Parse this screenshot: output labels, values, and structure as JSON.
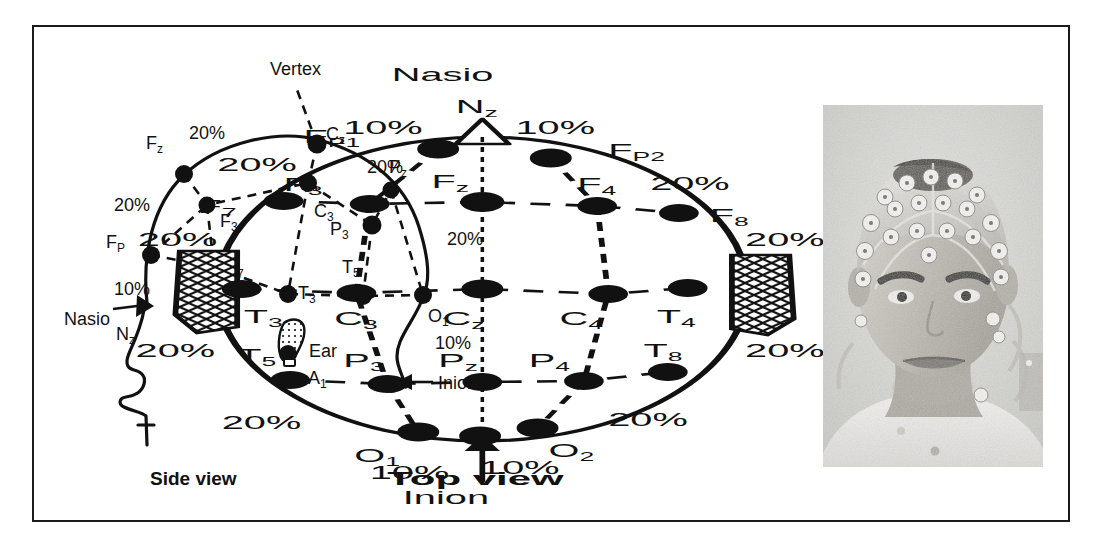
{
  "figure": {
    "caption_side": "Side view",
    "caption_top": "Top view",
    "percent_10": "10%",
    "percent_20": "20%",
    "landmark_nasion": "Nasio",
    "landmark_nasion_code": "Nz",
    "landmark_inion": "Inion",
    "landmark_vertex": "Vertex",
    "landmark_ear": "Ear",
    "ink_color": "#111111",
    "frame_color": "#1a1a1a",
    "background": "#ffffff"
  },
  "side_view": {
    "title": "Side view",
    "annotations": [
      {
        "text": "Vertex",
        "x": 246,
        "y": 47
      },
      {
        "text": "Nasio",
        "x": 34,
        "y": 295
      },
      {
        "text": "Ear",
        "x": 275,
        "y": 328
      },
      {
        "text": "Inion",
        "x": 404,
        "y": 360
      }
    ],
    "percent_labels": [
      {
        "text": "20%",
        "x": 160,
        "y": 110
      },
      {
        "text": "20%",
        "x": 336,
        "y": 144
      },
      {
        "text": "20%",
        "x": 84,
        "y": 182
      },
      {
        "text": "20%",
        "x": 416,
        "y": 215
      },
      {
        "text": "10%",
        "x": 87,
        "y": 265
      },
      {
        "text": "10%",
        "x": 406,
        "y": 318
      }
    ],
    "electrodes": [
      {
        "label": "F",
        "sub": "z",
        "cx": 150,
        "cy": 147,
        "r": 9,
        "lx": 112,
        "ly": 122
      },
      {
        "label": "C",
        "sub": "z",
        "cx": 283,
        "cy": 117,
        "r": 9.5,
        "lx": 292,
        "ly": 113
      },
      {
        "label": "P",
        "sub": "z",
        "cx": 357,
        "cy": 163,
        "r": 8.5,
        "lx": 358,
        "ly": 146
      },
      {
        "label": "F",
        "sub": "P",
        "cx": 117,
        "cy": 228,
        "r": 9,
        "lx": 74,
        "ly": 221
      },
      {
        "label": "F",
        "sub": "3",
        "cx": 173,
        "cy": 178,
        "r": 8.5,
        "lx": 186,
        "ly": 197
      },
      {
        "label": "C",
        "sub": "3",
        "cx": 274,
        "cy": 156,
        "r": 9,
        "lx": 280,
        "ly": 186
      },
      {
        "label": "P",
        "sub": "3",
        "cx": 338,
        "cy": 198,
        "r": 9.5,
        "lx": 299,
        "ly": 207
      },
      {
        "label": "F",
        "sub": "7",
        "cx": 180,
        "cy": 240,
        "r": 9,
        "lx": 192,
        "ly": 243
      },
      {
        "label": "T",
        "sub": "3",
        "cx": 254,
        "cy": 267,
        "r": 9,
        "lx": 264,
        "ly": 265
      },
      {
        "label": "T",
        "sub": "5",
        "cx": 329,
        "cy": 269,
        "r": 9,
        "lx": 310,
        "ly": 243
      },
      {
        "label": "O",
        "sub": "1",
        "cx": 389,
        "cy": 268,
        "r": 9,
        "lx": 395,
        "ly": 294
      },
      {
        "label": "N",
        "sub": "z",
        "cx": 113,
        "cy": 276,
        "r": 8,
        "lx": 84,
        "ly": 311
      },
      {
        "label": "A",
        "sub": "1",
        "cx": 257,
        "cy": 325,
        "r": 10,
        "lx": 274,
        "ly": 355
      }
    ]
  },
  "top_view": {
    "title": "Top view",
    "annotations": [
      {
        "text": "Nasio",
        "x": 597,
        "y": 50
      },
      {
        "text": "Inion",
        "x": 600,
        "y": 474
      }
    ],
    "percent_labels": [
      {
        "text": "10%",
        "x": 578,
        "y": 103
      },
      {
        "text": "10%",
        "x": 652,
        "y": 103
      },
      {
        "text": "20%",
        "x": 520,
        "y": 139
      },
      {
        "text": "20%",
        "x": 712,
        "y": 158
      },
      {
        "text": "20%",
        "x": 483,
        "y": 214
      },
      {
        "text": "20%",
        "x": 757,
        "y": 214
      },
      {
        "text": "20%",
        "x": 482,
        "y": 325
      },
      {
        "text": "20%",
        "x": 757,
        "y": 325
      },
      {
        "text": "20%",
        "x": 522,
        "y": 397
      },
      {
        "text": "20%",
        "x": 696,
        "y": 394
      },
      {
        "text": "10%",
        "x": 588,
        "y": 447
      },
      {
        "text": "10%",
        "x": 637,
        "y": 443
      }
    ],
    "electrodes": [
      {
        "label": "N",
        "sub": "z",
        "cx": 633,
        "cy": 98,
        "r": 0,
        "lx": 618,
        "ly": 80
      },
      {
        "label": "F",
        "sub": "P1",
        "cx": 613,
        "cy": 122,
        "r": 9.5,
        "lx": 556,
        "ly": 113
      },
      {
        "label": "F",
        "sub": "P2",
        "cx": 664,
        "cy": 131,
        "r": 9.5,
        "lx": 693,
        "ly": 127
      },
      {
        "label": "F",
        "sub": "7",
        "cx": 543,
        "cy": 174,
        "r": 9,
        "lx": 509,
        "ly": 183
      },
      {
        "label": "F",
        "sub": "3",
        "cx": 582,
        "cy": 177,
        "r": 9,
        "lx": 545,
        "ly": 161
      },
      {
        "label": "F",
        "sub": "z",
        "cx": 633,
        "cy": 175,
        "r": 10,
        "lx": 613,
        "ly": 158
      },
      {
        "label": "F",
        "sub": "4",
        "cx": 685,
        "cy": 179,
        "r": 9,
        "lx": 680,
        "ly": 160
      },
      {
        "label": "F",
        "sub": "8",
        "cx": 722,
        "cy": 186,
        "r": 9,
        "lx": 739,
        "ly": 190
      },
      {
        "label": "T",
        "sub": "3",
        "cx": 524,
        "cy": 262,
        "r": 9,
        "lx": 529,
        "ly": 292
      },
      {
        "label": "C",
        "sub": "3",
        "cx": 576,
        "cy": 266,
        "r": 9,
        "lx": 570,
        "ly": 294
      },
      {
        "label": "C",
        "sub": "z",
        "cx": 633,
        "cy": 262,
        "r": 9.5,
        "lx": 619,
        "ly": 295
      },
      {
        "label": "C",
        "sub": "4",
        "cx": 690,
        "cy": 267,
        "r": 9,
        "lx": 673,
        "ly": 294
      },
      {
        "label": "T",
        "sub": "4",
        "cx": 726,
        "cy": 261,
        "r": 9,
        "lx": 716,
        "ly": 292
      },
      {
        "label": "T",
        "sub": "5",
        "cx": 546,
        "cy": 353,
        "r": 9,
        "lx": 525,
        "ly": 332
      },
      {
        "label": "P",
        "sub": "3",
        "cx": 590,
        "cy": 357,
        "r": 9,
        "lx": 574,
        "ly": 337
      },
      {
        "label": "P",
        "sub": "z",
        "cx": 633,
        "cy": 355,
        "r": 9,
        "lx": 617,
        "ly": 337
      },
      {
        "label": "P",
        "sub": "4",
        "cx": 679,
        "cy": 354,
        "r": 9,
        "lx": 658,
        "ly": 337
      },
      {
        "label": "T",
        "sub": "8",
        "cx": 717,
        "cy": 345,
        "r": 9,
        "lx": 710,
        "ly": 327
      },
      {
        "label": "O",
        "sub": "1",
        "cx": 604,
        "cy": 405,
        "r": 9.5,
        "lx": 578,
        "ly": 432
      },
      {
        "label": "O",
        "sub": "2",
        "cx": 658,
        "cy": 401,
        "r": 9.5,
        "lx": 665,
        "ly": 428
      },
      {
        "label": "",
        "sub": "",
        "cx": 632,
        "cy": 409,
        "r": 9.5,
        "lx": 0,
        "ly": 0
      }
    ]
  },
  "photo": {
    "description": "photograph of subject wearing EEG electrode cap",
    "alt_name": "eeg-subject-photo"
  }
}
